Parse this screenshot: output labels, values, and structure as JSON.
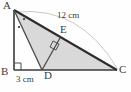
{
  "figure": {
    "name": "right-triangle-with-altitude",
    "background_color": "#fefefe",
    "stroke_color": "#3a3a3a",
    "fill_color": "#d9d9d9",
    "arc_color": "#c9c9c9"
  },
  "vertices": {
    "a": {
      "label": "A",
      "x": 14,
      "y": 10
    },
    "b": {
      "label": "B",
      "x": 14,
      "y": 70
    },
    "c": {
      "label": "C",
      "x": 117,
      "y": 70
    },
    "d": {
      "label": "D",
      "x": 42,
      "y": 70
    },
    "e": {
      "label": "E",
      "x": 60,
      "y": 38
    }
  },
  "measurements": {
    "hypotenuse": "12 cm",
    "base_segment": "3 cm"
  },
  "markers": {
    "right_angle_b": "right-angle-square",
    "right_angle_e": "right-angle-square",
    "angle_dots_a": "angle-dot-marks"
  }
}
